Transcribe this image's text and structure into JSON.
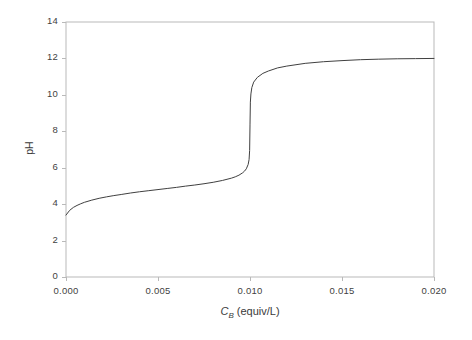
{
  "chart_data": {
    "type": "line",
    "title": "",
    "xlabel": "C_B (equiv/L)",
    "xlabel_parts": {
      "symbol": "C",
      "subscript": "B",
      "units": "(equiv/L)"
    },
    "ylabel": "pH",
    "xlim": [
      0.0,
      0.02
    ],
    "ylim": [
      0,
      14
    ],
    "xticks": [
      0.0,
      0.005,
      0.01,
      0.015,
      0.02
    ],
    "xtick_labels": [
      "0.000",
      "0.005",
      "0.010",
      "0.015",
      "0.020"
    ],
    "yticks": [
      0,
      2,
      4,
      6,
      8,
      10,
      12,
      14
    ],
    "ytick_labels": [
      "0",
      "2",
      "4",
      "6",
      "8",
      "10",
      "12",
      "14"
    ],
    "grid": false,
    "legend": null,
    "series": [
      {
        "name": "titration curve",
        "color": "#404040",
        "linewidth": 1.0,
        "x": [
          0.0,
          0.0002,
          0.0004,
          0.0006,
          0.0008,
          0.001,
          0.0014,
          0.0018,
          0.0022,
          0.0026,
          0.003,
          0.0035,
          0.004,
          0.0045,
          0.005,
          0.0055,
          0.006,
          0.0065,
          0.007,
          0.0075,
          0.008,
          0.0085,
          0.009,
          0.0092,
          0.0094,
          0.0096,
          0.0097,
          0.0098,
          0.0099,
          0.00995,
          0.00998,
          0.01,
          0.01002,
          0.01005,
          0.0101,
          0.0102,
          0.0104,
          0.0107,
          0.011,
          0.0115,
          0.012,
          0.013,
          0.014,
          0.015,
          0.016,
          0.017,
          0.018,
          0.019,
          0.02
        ],
        "y": [
          3.4,
          3.66,
          3.82,
          3.93,
          4.02,
          4.1,
          4.22,
          4.32,
          4.4,
          4.47,
          4.53,
          4.61,
          4.68,
          4.74,
          4.8,
          4.86,
          4.92,
          4.99,
          5.05,
          5.12,
          5.2,
          5.3,
          5.43,
          5.5,
          5.59,
          5.72,
          5.81,
          5.94,
          6.18,
          6.45,
          6.95,
          8.35,
          9.6,
          10.05,
          10.4,
          10.7,
          10.96,
          11.18,
          11.31,
          11.48,
          11.58,
          11.73,
          11.82,
          11.88,
          11.93,
          11.96,
          11.98,
          11.99,
          12.0
        ]
      }
    ],
    "axes_color": "#b9b9b9",
    "background": "#ffffff"
  },
  "layout": {
    "plot_left_px": 66,
    "plot_right_px": 434,
    "plot_top_px": 22,
    "plot_bottom_px": 277
  }
}
